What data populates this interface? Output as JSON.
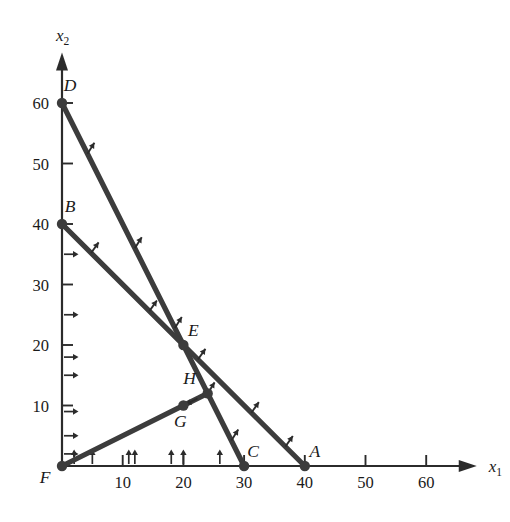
{
  "chart_data": {
    "type": "line",
    "title": "",
    "subtitle": "",
    "xlabel": "x_1",
    "xlabel_base": "x",
    "xlabel_sub": "1",
    "ylabel": "x_2",
    "ylabel_base": "x",
    "ylabel_sub": "2",
    "xlim": [
      0,
      68
    ],
    "ylim": [
      0,
      68
    ],
    "grid": false,
    "legend": "none",
    "x_ticks": [
      10,
      20,
      30,
      40,
      50,
      60
    ],
    "x_tick_labels": [
      "10",
      "20",
      "30",
      "40",
      "50",
      "60"
    ],
    "y_ticks": [
      10,
      20,
      30,
      40,
      50,
      60
    ],
    "y_tick_labels": [
      "10",
      "20",
      "30",
      "40",
      "50",
      "60"
    ],
    "x_hash_arrows": [
      2,
      5,
      11,
      12,
      18,
      20,
      26
    ],
    "y_hash_arrows": [
      2,
      5,
      9,
      15,
      18,
      25,
      35
    ],
    "series": [
      {
        "name": "constraint-DC",
        "from_label": "D",
        "to_label": "C",
        "points": [
          [
            0,
            60
          ],
          [
            30,
            0
          ]
        ],
        "direction_arrows": [
          {
            "t": 0.14,
            "angle": -58
          },
          {
            "t": 0.4,
            "angle": -58
          },
          {
            "t": 0.62,
            "angle": -58
          },
          {
            "t": 0.8,
            "angle": -58
          },
          {
            "t": 0.93,
            "angle": -58
          }
        ]
      },
      {
        "name": "constraint-BA",
        "from_label": "B",
        "to_label": "A",
        "points": [
          [
            0,
            40
          ],
          [
            40,
            0
          ]
        ],
        "direction_arrows": [
          {
            "t": 0.12,
            "angle": -55
          },
          {
            "t": 0.36,
            "angle": -55
          },
          {
            "t": 0.56,
            "angle": -55
          },
          {
            "t": 0.78,
            "angle": -55
          },
          {
            "t": 0.92,
            "angle": -55
          }
        ]
      },
      {
        "name": "ray-FGH",
        "from_label": "F",
        "to_label": "H",
        "points": [
          [
            0,
            0
          ],
          [
            24,
            12
          ]
        ],
        "direction_arrows": [
          {
            "t": 0.93,
            "angle": 153
          }
        ]
      }
    ],
    "annotations": [
      {
        "label": "A",
        "x": 40,
        "y": 0,
        "dot": true,
        "dx": 10,
        "dy": -9
      },
      {
        "label": "B",
        "x": 0,
        "y": 40,
        "dot": true,
        "dx": 8,
        "dy": -12
      },
      {
        "label": "C",
        "x": 30,
        "y": 0,
        "dot": true,
        "dx": 9,
        "dy": -9
      },
      {
        "label": "D",
        "x": 0,
        "y": 60,
        "dot": true,
        "dx": 8,
        "dy": -12
      },
      {
        "label": "E",
        "x": 20,
        "y": 20,
        "dot": true,
        "dx": 10,
        "dy": -9
      },
      {
        "label": "F",
        "x": 0,
        "y": 0,
        "dot": true,
        "dx": -17,
        "dy": 17
      },
      {
        "label": "G",
        "x": 20,
        "y": 10,
        "dot": true,
        "dx": -3,
        "dy": 21
      },
      {
        "label": "H",
        "x": 24,
        "y": 12,
        "dot": true,
        "dx": -18,
        "dy": -9
      }
    ]
  },
  "figure": {
    "name": "feasible-region-plot",
    "colors": {
      "background": "#ffffff",
      "axis": "#2b2b2b",
      "constraint": "#3c3c3c",
      "text": "#1a1a1a"
    }
  }
}
